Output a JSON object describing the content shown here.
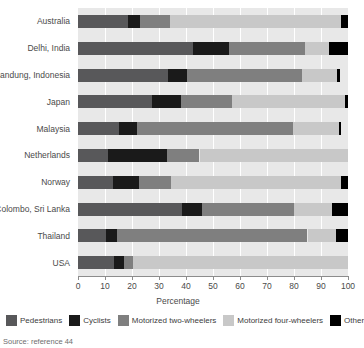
{
  "chart_data": {
    "type": "bar",
    "orientation": "horizontal",
    "stacked": true,
    "title": "",
    "xlabel": "Percentage",
    "ylabel": "",
    "xlim": [
      0,
      100
    ],
    "xticks": [
      0,
      10,
      20,
      30,
      40,
      50,
      60,
      70,
      80,
      90,
      100
    ],
    "grid": true,
    "legend_position": "bottom",
    "categories": [
      "Australia",
      "Delhi, India",
      "Bandung, Indonesia",
      "Japan",
      "Malaysia",
      "Netherlands",
      "Norway",
      "Colombo, Sri Lanka",
      "Thailand",
      "USA"
    ],
    "series": [
      {
        "name": "Pedestrians",
        "color": "#58585a",
        "values": [
          18.5,
          42.5,
          33.5,
          27.5,
          15,
          11,
          13,
          38.5,
          10.5,
          13.5
        ]
      },
      {
        "name": "Cyclists",
        "color": "#1a1a1a",
        "values": [
          4.5,
          13.5,
          7,
          10.5,
          7,
          22,
          9.5,
          7.5,
          4,
          3.5
        ]
      },
      {
        "name": "Motorized two-wheelers",
        "color": "#7f7f7f",
        "values": [
          11,
          28,
          42.5,
          19,
          57.5,
          12,
          12,
          34,
          70.5,
          3.5
        ]
      },
      {
        "name": "Motorized four-wheelers",
        "color": "#c8c8c8",
        "values": [
          63.5,
          9,
          13,
          42,
          17,
          55,
          63,
          14,
          10.5,
          79.5
        ]
      },
      {
        "name": "Other",
        "color": "#000000",
        "values": [
          2.5,
          7,
          1,
          1,
          1,
          0,
          2.5,
          6,
          4.5,
          0
        ]
      }
    ]
  },
  "legend": {
    "items": [
      {
        "label": "Pedestrians",
        "color": "#58585a"
      },
      {
        "label": "Cyclists",
        "color": "#1a1a1a"
      },
      {
        "label": "Motorized two-wheelers",
        "color": "#7f7f7f"
      },
      {
        "label": "Motorized four-wheelers",
        "color": "#c8c8c8"
      },
      {
        "label": "Other",
        "color": "#000000"
      }
    ]
  },
  "footer": {
    "source": "Source: reference 44"
  },
  "style": {
    "plot_background": "#e8e8e8",
    "gridline_color": "#ffffff",
    "axis_color": "#8c8c8c"
  }
}
